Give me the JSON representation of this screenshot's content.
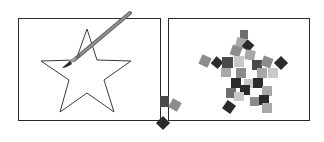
{
  "illustration": {
    "left_panel": {
      "description": "outline-star-with-paintbrush",
      "stroke_color": "#3a3a3a",
      "brush_colors": [
        "#6a6a6a",
        "#9a9a9a",
        "#2a2a2a"
      ]
    },
    "right_panel": {
      "description": "star-filled-with-scattered-squares",
      "square_colors": [
        "#2b2b2b",
        "#4a4a4a",
        "#6e6e6e",
        "#8c8c8c",
        "#a8a8a8",
        "#c8c8c8"
      ]
    },
    "colors": {
      "frame": "#2a2a2a",
      "background": "#ffffff"
    }
  }
}
